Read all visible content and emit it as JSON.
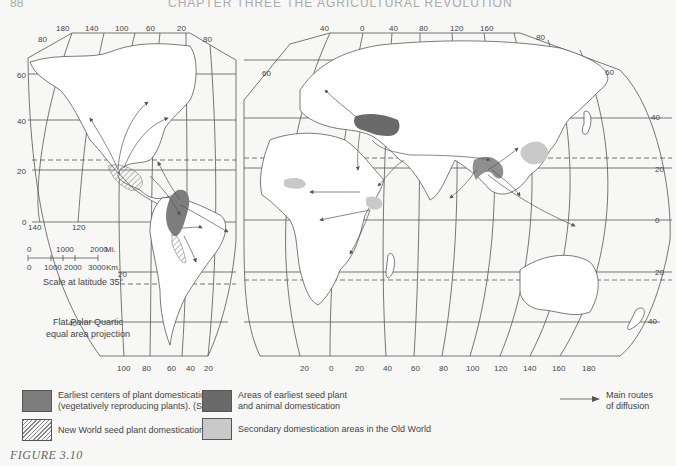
{
  "header": {
    "page_number": "88",
    "chapter_title": "CHAPTER THREE   THE AGRICULTURAL REVOLUTION"
  },
  "map": {
    "projection": "Flat Polar Quartic",
    "projection_lines": [
      "Flat Polar Quartic",
      "equal area projection"
    ],
    "western_lobe": {
      "top_longitudes": [
        "180",
        "140",
        "100",
        "60",
        "20"
      ],
      "bottom_longitudes": [
        "100",
        "80",
        "60",
        "40",
        "20"
      ],
      "left_latitudes": [
        "80",
        "60",
        "40",
        "20",
        "0",
        "20",
        "40"
      ],
      "corner_latitude_right": "80",
      "lower_longitudes_left": [
        "140",
        "120"
      ]
    },
    "eastern_lobe": {
      "top_longitudes": [
        "40",
        "0",
        "40",
        "80",
        "120",
        "160"
      ],
      "bottom_longitudes": [
        "20",
        "0",
        "20",
        "40",
        "60",
        "80",
        "100",
        "120",
        "140",
        "160",
        "180"
      ],
      "right_latitudes": [
        "80",
        "60",
        "40",
        "20",
        "0",
        "20",
        "40"
      ],
      "left_latitudes": [
        "60"
      ]
    },
    "scale": {
      "miles_ticks": [
        "0",
        "1000",
        "2000"
      ],
      "miles_unit": "Mi.",
      "km_ticks": [
        "0",
        "1000",
        "2000",
        "3000"
      ],
      "km_unit": "Km.",
      "caption": "Scale at latitude 35°"
    },
    "colors": {
      "earliest_vegetative": "#7d7d7d",
      "earliest_seed_animal": "#6a6a6a",
      "secondary_old_world": "#c9c9c9",
      "new_world_hatch": "#888888",
      "lines": "#444444"
    }
  },
  "legend": {
    "items": [
      {
        "label_line1": "Earliest centers of plant domestication",
        "label_line2": "(vegetatively reproducing plants). (Sauer)",
        "swatch": "solid-medium-gray"
      },
      {
        "label_line1": "New World seed plant domestication areas",
        "swatch": "hatched"
      },
      {
        "label_line1": "Areas of earliest seed plant",
        "label_line2": "and animal domestication",
        "swatch": "solid-dark-gray"
      },
      {
        "label_line1": "Secondary domestication areas in the Old World",
        "swatch": "solid-light-gray"
      }
    ],
    "routes": {
      "label_line1": "Main routes",
      "label_line2": "of diffusion"
    }
  },
  "figure_caption": "FIGURE 3.10"
}
